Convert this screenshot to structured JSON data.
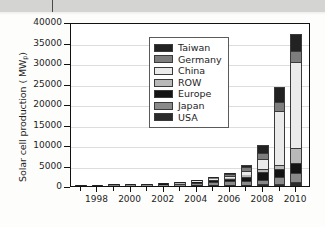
{
  "page": {
    "background_color": "#fdfdfc",
    "header_band_color": "#d4d4d2"
  },
  "chart_data": {
    "type": "bar",
    "stacked": true,
    "title": "",
    "xlabel": "",
    "ylabel": "Solar cell production ( MW",
    "ylabel_subscript": "p",
    "ylabel_suffix": ")",
    "ylim": [
      0,
      40000
    ],
    "ytick_values": [
      0,
      5000,
      10000,
      15000,
      20000,
      25000,
      30000,
      35000,
      40000
    ],
    "ytick_labels": [
      "0",
      "5000",
      "10000",
      "15000",
      "20000",
      "25000",
      "30000",
      "35000",
      "40000"
    ],
    "grid": true,
    "grid_axis": "y",
    "legend_position": "upper left",
    "x": [
      1997,
      1998,
      1999,
      2000,
      2001,
      2002,
      2003,
      2004,
      2005,
      2006,
      2007,
      2008,
      2009,
      2010
    ],
    "xtick_values": [
      1998,
      2000,
      2002,
      2004,
      2006,
      2008,
      2010
    ],
    "xtick_labels": [
      "1998",
      "2000",
      "2002",
      "2004",
      "2006",
      "2008",
      "2010"
    ],
    "xlim": [
      1996.4,
      2010.9
    ],
    "series": [
      {
        "name": "USA",
        "color": "#2b2b2b",
        "values": [
          51,
          54,
          61,
          75,
          100,
          121,
          103,
          139,
          154,
          202,
          266,
          414,
          595,
          1100
        ]
      },
      {
        "name": "Japan",
        "color": "#8a8a8a",
        "values": [
          35,
          49,
          80,
          129,
          171,
          251,
          364,
          602,
          833,
          927,
          920,
          1170,
          1500,
          2150
        ]
      },
      {
        "name": "Europe",
        "color": "#141414",
        "values": [
          30,
          34,
          40,
          61,
          86,
          135,
          193,
          314,
          470,
          680,
          1063,
          1900,
          2000,
          2400
        ]
      },
      {
        "name": "ROW",
        "color": "#b9b9b9",
        "values": [
          9,
          12,
          15,
          23,
          30,
          38,
          50,
          81,
          120,
          180,
          320,
          620,
          1100,
          3700
        ]
      },
      {
        "name": "China",
        "color": "#ebebeb",
        "values": [
          2,
          3,
          4,
          6,
          9,
          15,
          30,
          65,
          130,
          370,
          1100,
          2600,
          13000,
          21000
        ]
      },
      {
        "name": "Germany",
        "color": "#7d7d7d",
        "values": [
          5,
          7,
          10,
          18,
          30,
          55,
          100,
          190,
          310,
          510,
          860,
          1450,
          2200,
          2500
        ]
      },
      {
        "name": "Taiwan",
        "color": "#222222",
        "values": [
          0,
          0,
          1,
          2,
          4,
          10,
          25,
          60,
          120,
          270,
          720,
          1750,
          3700,
          4300
        ]
      }
    ],
    "legend_entries": [
      {
        "label": "Taiwan",
        "color": "#222222"
      },
      {
        "label": "Germany",
        "color": "#7d7d7d"
      },
      {
        "label": "China",
        "color": "#ebebeb"
      },
      {
        "label": "ROW",
        "color": "#b9b9b9"
      },
      {
        "label": "Europe",
        "color": "#141414"
      },
      {
        "label": "Japan",
        "color": "#8a8a8a"
      },
      {
        "label": "USA",
        "color": "#2b2b2b"
      }
    ]
  }
}
